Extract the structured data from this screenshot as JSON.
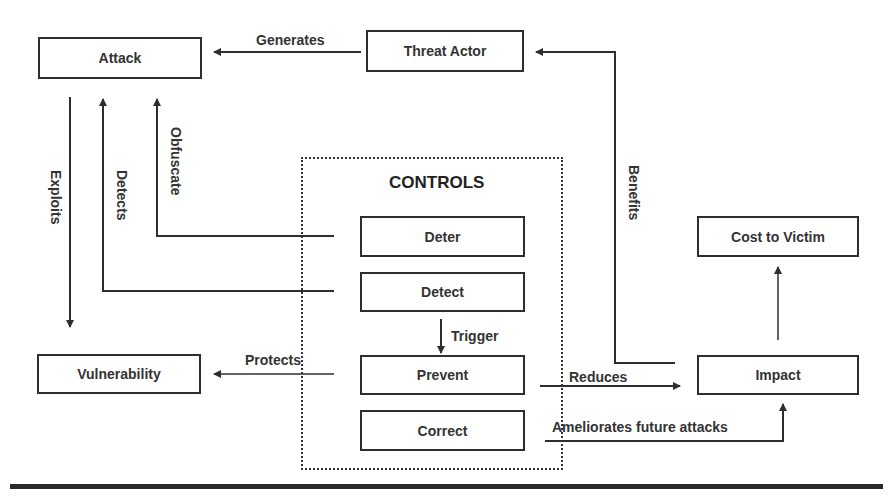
{
  "diagram": {
    "nodes": {
      "attack": "Attack",
      "threat_actor": "Threat Actor",
      "vulnerability": "Vulnerability",
      "cost_to_victim": "Cost to Victim",
      "impact": "Impact"
    },
    "controls": {
      "title": "CONTROLS",
      "items": [
        "Deter",
        "Detect",
        "Prevent",
        "Correct"
      ]
    },
    "edges": {
      "generates": "Generates",
      "exploits": "Exploits",
      "detects": "Detects",
      "obfuscate": "Obfuscate",
      "benefits": "Benefits",
      "trigger": "Trigger",
      "protects": "Protects",
      "reduces": "Reduces",
      "ameliorates": "Ameliorates future attacks"
    },
    "colors": {
      "line": "#2e2e2e",
      "background": "#ffffff"
    }
  }
}
